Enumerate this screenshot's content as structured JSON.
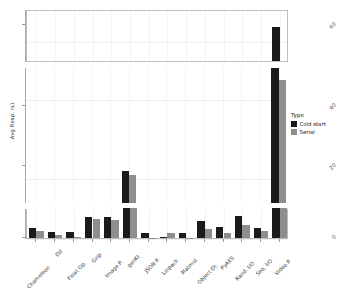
{
  "chart_data": {
    "type": "bar",
    "title": "",
    "xlabel": "",
    "ylabel": "Avg Resp. (s)",
    "grid": true,
    "legend_position": "right",
    "legend_title": "Type",
    "broken_axis": true,
    "panels": [
      {
        "name": "top",
        "ylim": [
          56,
          66
        ],
        "ticks": [
          60
        ]
      },
      {
        "name": "middle",
        "ylim": [
          14,
          48
        ],
        "ticks": [
          20,
          40
        ]
      },
      {
        "name": "bottom",
        "ylim": [
          0,
          6
        ],
        "ticks": [
          0
        ]
      }
    ],
    "categories": [
      "Chameleon",
      "Dd",
      "Float Op.",
      "Gzip",
      "Image P.",
      "genKI",
      "JSON P.",
      "Linpack",
      "Matmul",
      "Object Dt.",
      "PyAES",
      "Rand. I/O",
      "Seq. I/O",
      "Video P."
    ],
    "series": [
      {
        "name": "Cold start",
        "color": "#1b1b1b",
        "values": [
          2.1,
          1.2,
          1.3,
          4.2,
          4.3,
          22.0,
          1.1,
          0.15,
          1.0,
          3.4,
          2.3,
          4.4,
          2.1,
          62.5
        ]
      },
      {
        "name": "Serial",
        "color": "#8e8e8e",
        "values": [
          1.4,
          0.6,
          0.15,
          3.9,
          3.6,
          21.0,
          0.1,
          1.1,
          0.1,
          1.9,
          1.1,
          2.6,
          1.5,
          45.0
        ]
      }
    ]
  },
  "axis": {
    "y_title": "Avg Resp. (s)",
    "y_ticks_top": [
      "60"
    ],
    "y_ticks_mid": [
      "40",
      "20"
    ],
    "y_ticks_bot": [
      "0"
    ]
  },
  "legend": {
    "title": "Type",
    "items": [
      {
        "label": "Cold start",
        "color": "#1b1b1b"
      },
      {
        "label": "Serial",
        "color": "#8e8e8e"
      }
    ]
  }
}
